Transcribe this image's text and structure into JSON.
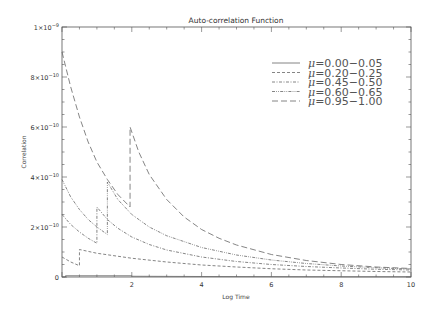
{
  "chart_data": {
    "type": "line",
    "title": "Auto-correlation Function",
    "xlabel": "Log Time",
    "ylabel": "Correlation",
    "xlim": [
      0,
      10
    ],
    "ylim": [
      0,
      1e-09
    ],
    "x_ticks": [
      {
        "value": 2,
        "label": "2"
      },
      {
        "value": 4,
        "label": "4"
      },
      {
        "value": 6,
        "label": "6"
      },
      {
        "value": 8,
        "label": "8"
      },
      {
        "value": 10,
        "label": "10"
      }
    ],
    "y_ticks": [
      {
        "value": 0,
        "label": "0"
      },
      {
        "value": 2e-10,
        "label": "2×10",
        "exp": "−10"
      },
      {
        "value": 4e-10,
        "label": "4×10",
        "exp": "−10"
      },
      {
        "value": 6e-10,
        "label": "6×10",
        "exp": "−10"
      },
      {
        "value": 8e-10,
        "label": "8×10",
        "exp": "−10"
      },
      {
        "value": 1e-09,
        "label": "1×10",
        "exp": "−9"
      }
    ],
    "grid": false,
    "legend_position": "upper-right",
    "series": [
      {
        "name": "μ=0.00−0.05",
        "mu_label": "μ",
        "range_label": "=0.00−0.05",
        "style": "solid",
        "points": [
          [
            0.0,
            0.0
          ],
          [
            0.1,
            0.0
          ],
          [
            0.1,
            5e-12
          ],
          [
            2.0,
            5e-12
          ],
          [
            2.0,
            3e-12
          ],
          [
            4.0,
            2e-12
          ],
          [
            6.0,
            1.5e-12
          ],
          [
            8.0,
            1e-12
          ],
          [
            10.0,
            1e-12
          ]
        ]
      },
      {
        "name": "μ=0.20−0.25",
        "mu_label": "μ",
        "range_label": "=0.20−0.25",
        "style": "dashed",
        "points": [
          [
            0.0,
            8e-11
          ],
          [
            0.25,
            6e-11
          ],
          [
            0.5,
            4.5e-11
          ],
          [
            0.5,
            1.1e-10
          ],
          [
            1.0,
            9.5e-11
          ],
          [
            2.0,
            7.5e-11
          ],
          [
            3.0,
            6e-11
          ],
          [
            4.0,
            4.8e-11
          ],
          [
            5.0,
            4e-11
          ],
          [
            6.0,
            3.3e-11
          ],
          [
            7.0,
            2.8e-11
          ],
          [
            8.0,
            2.5e-11
          ],
          [
            9.0,
            2.2e-11
          ],
          [
            10.0,
            2e-11
          ]
        ]
      },
      {
        "name": "μ=0.45−0.50",
        "mu_label": "μ",
        "range_label": "=0.45−0.50",
        "style": "dash-dot",
        "points": [
          [
            0.0,
            2.5e-10
          ],
          [
            0.25,
            2.1e-10
          ],
          [
            0.5,
            1.8e-10
          ],
          [
            0.75,
            1.55e-10
          ],
          [
            1.0,
            1.35e-10
          ],
          [
            1.0,
            2.8e-10
          ],
          [
            1.3,
            2.3e-10
          ],
          [
            1.6,
            1.95e-10
          ],
          [
            2.0,
            1.6e-10
          ],
          [
            2.5,
            1.3e-10
          ],
          [
            3.0,
            1.08e-10
          ],
          [
            4.0,
            8e-11
          ],
          [
            5.0,
            6.2e-11
          ],
          [
            6.0,
            5e-11
          ],
          [
            7.0,
            4.2e-11
          ],
          [
            8.0,
            3.6e-11
          ],
          [
            9.0,
            3.1e-11
          ],
          [
            10.0,
            2.8e-11
          ]
        ]
      },
      {
        "name": "μ=0.60−0.65",
        "mu_label": "μ",
        "range_label": "=0.60−0.65",
        "style": "dash-dot-dot",
        "points": [
          [
            0.0,
            3.9e-10
          ],
          [
            0.25,
            3.2e-10
          ],
          [
            0.5,
            2.7e-10
          ],
          [
            0.75,
            2.3e-10
          ],
          [
            1.0,
            2e-10
          ],
          [
            1.3,
            1.7e-10
          ],
          [
            1.3,
            3.8e-10
          ],
          [
            1.6,
            3.1e-10
          ],
          [
            2.0,
            2.5e-10
          ],
          [
            2.5,
            2e-10
          ],
          [
            3.0,
            1.65e-10
          ],
          [
            4.0,
            1.18e-10
          ],
          [
            5.0,
            8.8e-11
          ],
          [
            6.0,
            6.8e-11
          ],
          [
            7.0,
            5.4e-11
          ],
          [
            8.0,
            4.4e-11
          ],
          [
            9.0,
            3.7e-11
          ],
          [
            10.0,
            3.2e-11
          ]
        ]
      },
      {
        "name": "μ=0.95−1.00",
        "mu_label": "μ",
        "range_label": "=0.95−1.00",
        "style": "long-dash",
        "points": [
          [
            0.0,
            9e-10
          ],
          [
            0.25,
            7.6e-10
          ],
          [
            0.5,
            6.4e-10
          ],
          [
            0.75,
            5.4e-10
          ],
          [
            1.0,
            4.6e-10
          ],
          [
            1.3,
            3.9e-10
          ],
          [
            1.6,
            3.3e-10
          ],
          [
            1.95,
            2.8e-10
          ],
          [
            1.95,
            6e-10
          ],
          [
            2.2,
            5e-10
          ],
          [
            2.5,
            4.1e-10
          ],
          [
            3.0,
            3.1e-10
          ],
          [
            3.5,
            2.4e-10
          ],
          [
            4.0,
            1.9e-10
          ],
          [
            4.5,
            1.55e-10
          ],
          [
            5.0,
            1.28e-10
          ],
          [
            6.0,
            9e-11
          ],
          [
            7.0,
            6.6e-11
          ],
          [
            8.0,
            5e-11
          ],
          [
            9.0,
            4e-11
          ],
          [
            10.0,
            3.4e-11
          ]
        ]
      }
    ]
  },
  "colors": {
    "background": "#ffffff",
    "axis": "#555555",
    "line": "#666666",
    "text": "#333333"
  }
}
